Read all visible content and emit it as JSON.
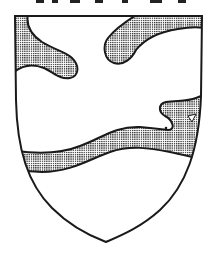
{
  "image": {
    "description": "Coat of arms shield with dotted (stippled) charges on white field",
    "caption_cropped": "",
    "colors": {
      "field": "#ffffff",
      "outline": "#1a1a1a",
      "charge_pattern": "#2a2a2a"
    }
  },
  "shield": {
    "label": "Heraldic shield",
    "charges": [
      {
        "name": "upper-left-wave",
        "tincture": "stippled"
      },
      {
        "name": "upper-right-hook",
        "tincture": "stippled"
      },
      {
        "name": "middle-wavy-band-with-head",
        "tincture": "stippled"
      }
    ]
  }
}
